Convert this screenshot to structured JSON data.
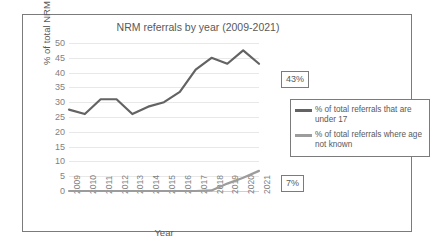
{
  "chart_data": {
    "type": "line",
    "title": "NRM referrals by year (2009-2021)",
    "xlabel": "Year",
    "ylabel": "% of total NRM referrals",
    "categories": [
      "2009",
      "2010",
      "2011",
      "2012",
      "2013",
      "2014",
      "2015",
      "2016",
      "2017",
      "2018",
      "2019",
      "2020",
      "2021"
    ],
    "ylim": [
      0,
      50
    ],
    "ytick_step": 5,
    "yticks": [
      "50",
      "45",
      "40",
      "35",
      "30",
      "25",
      "20",
      "15",
      "10",
      "5",
      "0"
    ],
    "grid": true,
    "legend_position": "right",
    "series": [
      {
        "name": "% of total referrals that are under 17",
        "color": "#636363",
        "values": [
          27.5,
          26.0,
          31.0,
          31.0,
          26.0,
          28.5,
          30.0,
          33.5,
          41.0,
          45.0,
          43.0,
          47.5,
          43.0
        ],
        "end_label": "43%"
      },
      {
        "name": "% of total referrals where age not known",
        "color": "#9c9c9c",
        "values": [
          0,
          0,
          0,
          0,
          0,
          0,
          0,
          0,
          0,
          0.2,
          2.5,
          4.5,
          6.8
        ],
        "end_label": "7%"
      }
    ]
  },
  "legend": {
    "entries": [
      {
        "label": "% of total referrals that are under 17"
      },
      {
        "label": "% of total referrals where age not known"
      }
    ]
  },
  "labels": {
    "under17_value": "43%",
    "unknown_value": "7%"
  }
}
